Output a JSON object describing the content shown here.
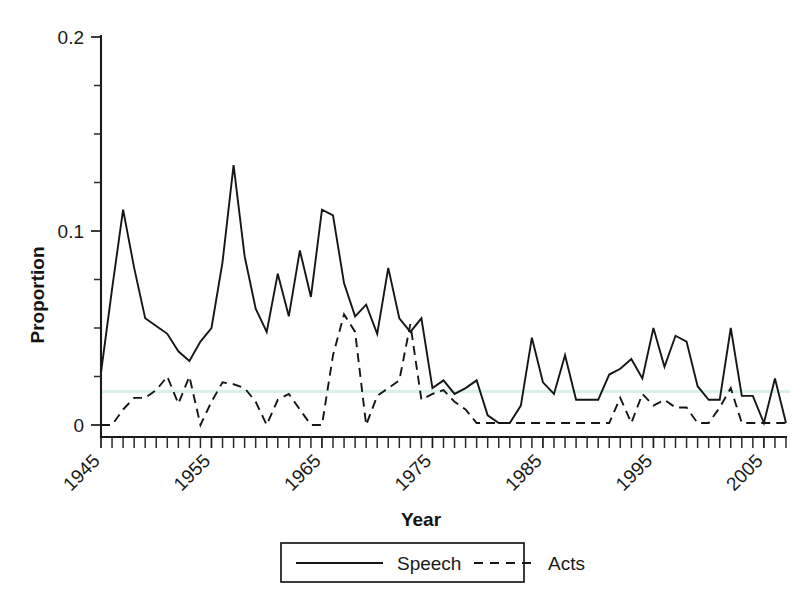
{
  "chart_data": {
    "type": "line",
    "title": "",
    "xlabel": "Year",
    "ylabel": "Proportion",
    "xlim": [
      1945,
      2007
    ],
    "ylim": [
      0,
      0.2
    ],
    "grid": false,
    "legend_position": "bottom-outside",
    "x_tick_labels": [
      "1945",
      "1955",
      "1965",
      "1975",
      "1985",
      "1995",
      "2005"
    ],
    "x_tick_values": [
      1945,
      1955,
      1965,
      1975,
      1985,
      1995,
      2005
    ],
    "x_minor_tick_step": 1,
    "y_tick_labels": [
      "0",
      "0.1",
      "0.2"
    ],
    "y_tick_values": [
      0,
      0.1,
      0.2
    ],
    "y_minor_tick_step": 0.025,
    "x": [
      1945,
      1946,
      1947,
      1948,
      1949,
      1950,
      1951,
      1952,
      1953,
      1954,
      1955,
      1956,
      1957,
      1958,
      1959,
      1960,
      1961,
      1962,
      1963,
      1964,
      1965,
      1966,
      1967,
      1968,
      1969,
      1970,
      1971,
      1972,
      1973,
      1974,
      1975,
      1976,
      1977,
      1978,
      1979,
      1980,
      1981,
      1982,
      1983,
      1984,
      1985,
      1986,
      1987,
      1988,
      1989,
      1990,
      1991,
      1992,
      1993,
      1994,
      1995,
      1996,
      1997,
      1998,
      1999,
      2000,
      2001,
      2002,
      2003,
      2004,
      2005,
      2006,
      2007
    ],
    "series": [
      {
        "name": "Speech",
        "style": "solid",
        "color": "#161616",
        "values": [
          0.027,
          0.07,
          0.111,
          0.081,
          0.055,
          0.051,
          0.047,
          0.038,
          0.033,
          0.043,
          0.05,
          0.084,
          0.134,
          0.087,
          0.06,
          0.048,
          0.078,
          0.056,
          0.09,
          0.066,
          0.111,
          0.108,
          0.073,
          0.056,
          0.062,
          0.047,
          0.081,
          0.055,
          0.048,
          0.055,
          0.019,
          0.023,
          0.016,
          0.019,
          0.023,
          0.005,
          0.001,
          0.001,
          0.01,
          0.045,
          0.022,
          0.016,
          0.036,
          0.013,
          0.013,
          0.013,
          0.026,
          0.029,
          0.034,
          0.024,
          0.05,
          0.03,
          0.046,
          0.043,
          0.02,
          0.013,
          0.013,
          0.05,
          0.015,
          0.015,
          0.001,
          0.024,
          0.001
        ],
        "description": "Solid black line, peaks at 0.134 in 1957 and 0.111 in 1947 and 1965"
      },
      {
        "name": "Acts",
        "style": "dashed",
        "color": "#161616",
        "values": [
          0.0,
          0.0,
          0.008,
          0.014,
          0.014,
          0.018,
          0.025,
          0.011,
          0.025,
          0.0,
          0.012,
          0.022,
          0.021,
          0.019,
          0.012,
          0.0,
          0.013,
          0.016,
          0.008,
          0.0,
          0.0,
          0.036,
          0.057,
          0.048,
          0.0,
          0.015,
          0.019,
          0.023,
          0.052,
          0.013,
          0.016,
          0.018,
          0.012,
          0.008,
          0.001,
          0.001,
          0.001,
          0.001,
          0.001,
          0.001,
          0.001,
          0.001,
          0.001,
          0.001,
          0.001,
          0.001,
          0.001,
          0.014,
          0.001,
          0.016,
          0.01,
          0.013,
          0.009,
          0.009,
          0.001,
          0.001,
          0.009,
          0.019,
          0.001,
          0.001,
          0.001,
          0.001,
          0.001
        ],
        "description": "Dashed black line, peaks at 0.057 in 1967 and 0.052 in 1973"
      }
    ]
  },
  "legend": {
    "entries": [
      {
        "label": "Speech",
        "style": "solid"
      },
      {
        "label": "Acts",
        "style": "dashed"
      }
    ]
  },
  "axes": {
    "y_title": "Proportion",
    "x_title": "Year"
  }
}
